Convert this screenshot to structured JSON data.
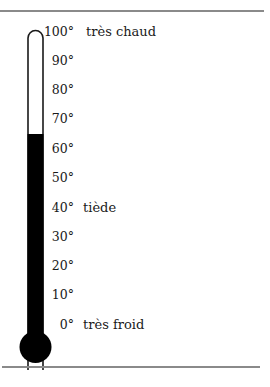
{
  "diagram": {
    "type": "thermometer",
    "scale_min": 0,
    "scale_max": 100,
    "current_level": 65,
    "ticks": [
      "100°",
      "90°",
      "80°",
      "70°",
      "60°",
      "50°",
      "40°",
      "30°",
      "20°",
      "10°",
      "0°"
    ],
    "annotations": {
      "hot": "très chaud",
      "warm": "tiède",
      "cold": "très froid"
    },
    "colors": {
      "mercury": "#000000",
      "tube_outline": "#1a1a1a",
      "rule": "#8a8a8a"
    }
  }
}
